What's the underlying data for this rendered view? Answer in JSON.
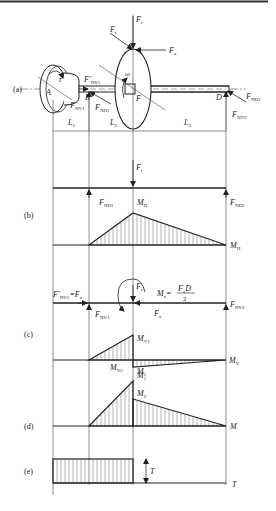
{
  "figure": {
    "panels": {
      "a": "(a)",
      "b": "(b)",
      "c": "(c)",
      "d": "(d)",
      "e": "(e)"
    },
    "points": {
      "A": "A",
      "B": "B",
      "F": "F",
      "D": "D"
    },
    "spans": {
      "L1": "L",
      "L1_sub": "1",
      "L2": "L",
      "L2_sub": "2",
      "L3": "L",
      "L3_sub": "3"
    },
    "forces": {
      "Fr": {
        "main": "F",
        "sub": "r"
      },
      "Ft": {
        "main": "F",
        "sub": "t"
      },
      "Fa": {
        "main": "F",
        "sub": "a"
      },
      "FNV1_prime": {
        "main": "F′",
        "sub": "NV1"
      },
      "FNV1": {
        "main": "F",
        "sub": "NV1"
      },
      "FNH1": {
        "main": "F",
        "sub": "NH1"
      },
      "FNH2": {
        "main": "F",
        "sub": "NH2"
      },
      "FNV2": {
        "main": "F",
        "sub": "NV2"
      },
      "omega": "ω",
      "T": "T"
    },
    "panel_b": {
      "Ft": {
        "main": "F",
        "sub": "t"
      },
      "FNH1": {
        "main": "F",
        "sub": "NH1"
      },
      "FNH2": {
        "main": "F",
        "sub": "NH2"
      },
      "MH_peak": {
        "main": "M",
        "sub": "H"
      },
      "MH_axis": {
        "main": "M",
        "sub": "H"
      }
    },
    "panel_c": {
      "FNV1_eq": {
        "main": "F′",
        "sub": "NV1",
        "rest": "=F",
        "rest_sub": "a"
      },
      "Fr": {
        "main": "F",
        "sub": "r"
      },
      "Ma": {
        "main": "M",
        "sub": "a",
        "eq": "=",
        "num": "F",
        "num_sub": "a",
        "num_rest": "D",
        "den": "2"
      },
      "FNV1": {
        "main": "F",
        "sub": "NV1"
      },
      "Fa": {
        "main": "F",
        "sub": "a"
      },
      "FNV2": {
        "main": "F",
        "sub": "NV2"
      },
      "MV1": {
        "main": "M",
        "sub": "V1"
      },
      "MV2": {
        "main": "M",
        "sub": "V2"
      },
      "M1c": {
        "main": "M",
        "sub": "1"
      },
      "MV_axis": {
        "main": "M",
        "sub": "V"
      }
    },
    "panel_d": {
      "M1": {
        "main": "M",
        "sub": "1"
      },
      "M2": {
        "main": "M",
        "sub": "2"
      },
      "M_axis": "M"
    },
    "panel_e": {
      "T_dim": "T",
      "T_axis": "T"
    },
    "colors": {
      "line": "#222222",
      "hatch": "#555555",
      "background": "#ffffff"
    }
  }
}
